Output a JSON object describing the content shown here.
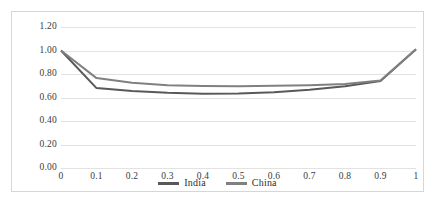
{
  "chart_data": {
    "type": "line",
    "title": "",
    "subtitle": "",
    "xlabel": "",
    "ylabel": "",
    "x": [
      0,
      0.1,
      0.2,
      0.3,
      0.4,
      0.5,
      0.6,
      0.7,
      0.8,
      0.9,
      1
    ],
    "categories": [
      "0",
      "0.1",
      "0.2",
      "0.3",
      "0.4",
      "0.5",
      "0.6",
      "0.7",
      "0.8",
      "0.9",
      "1"
    ],
    "series": [
      {
        "name": "India",
        "color": "#595959",
        "values": [
          1.0,
          0.68,
          0.655,
          0.64,
          0.632,
          0.635,
          0.645,
          0.665,
          0.695,
          0.74,
          1.01
        ]
      },
      {
        "name": "China",
        "color": "#808080",
        "values": [
          1.0,
          0.765,
          0.725,
          0.705,
          0.697,
          0.695,
          0.7,
          0.705,
          0.715,
          0.745,
          1.01
        ]
      }
    ],
    "ylim": [
      0.0,
      1.2
    ],
    "xlim": [
      0,
      1
    ],
    "yticks": [
      0.0,
      0.2,
      0.4,
      0.6,
      0.8,
      1.0,
      1.2
    ],
    "ytick_labels": [
      "0.00",
      "0.20",
      "0.40",
      "0.60",
      "0.80",
      "1.00",
      "1.20"
    ],
    "xtick_labels": [
      "0",
      "0.1",
      "0.2",
      "0.3",
      "0.4",
      "0.5",
      "0.6",
      "0.7",
      "0.8",
      "0.9",
      "1"
    ],
    "grid": {
      "horizontal": true,
      "vertical": false,
      "color": "#e2e2e2"
    },
    "legend": {
      "position": "bottom-center",
      "entries": [
        {
          "label": "India",
          "color": "#595959"
        },
        {
          "label": "China",
          "color": "#808080"
        }
      ]
    },
    "frame": {
      "border_color": "#d6d6d6",
      "background": "#ffffff"
    }
  }
}
